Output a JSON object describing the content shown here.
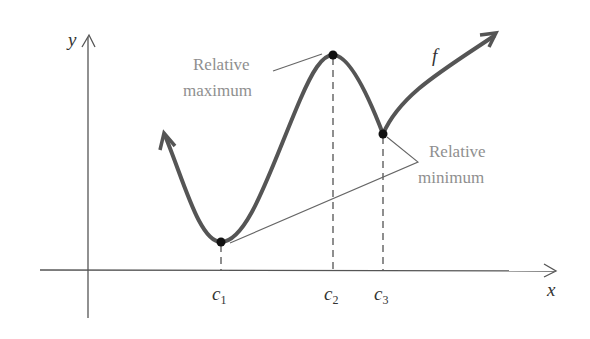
{
  "diagram": {
    "axes": {
      "x_label": "x",
      "y_label": "y"
    },
    "function_label": "f",
    "critical_points": [
      {
        "name": "c",
        "sub": "1",
        "type": "relative minimum"
      },
      {
        "name": "c",
        "sub": "2",
        "type": "relative maximum"
      },
      {
        "name": "c",
        "sub": "3",
        "type": "relative minimum"
      }
    ],
    "annotations": {
      "max_line1": "Relative",
      "max_line2": "maximum",
      "min_line1": "Relative",
      "min_line2": "minimum"
    },
    "colors": {
      "curve": "#555555",
      "axis": "#555555",
      "label": "#8f8f8f",
      "point": "#111111"
    }
  }
}
